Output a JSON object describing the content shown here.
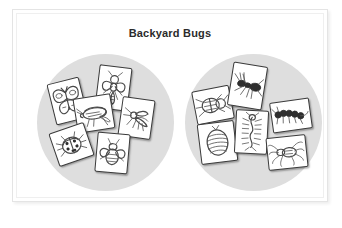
{
  "slide": {
    "title": "Backyard Bugs",
    "background_color": "#ffffff",
    "frame_border_color": "#e4e4e4",
    "title_color": "#2b2b2b"
  },
  "caption": {
    "text": "",
    "note_visible": false
  },
  "groups": [
    {
      "name": "left-group",
      "label": "",
      "fill_color": "#dedede",
      "cards": [
        {
          "name": "card-butterfly",
          "subject": "butterfly",
          "icon": "butterfly-icon",
          "rotation": -14,
          "x": 14,
          "y": 26,
          "w": 33,
          "h": 42
        },
        {
          "name": "card-wasp",
          "subject": "wasp",
          "icon": "wasp-icon",
          "rotation": 7,
          "x": 60,
          "y": 12,
          "w": 33,
          "h": 44
        },
        {
          "name": "card-grasshopper",
          "subject": "grasshopper",
          "icon": "grasshopper-icon",
          "rotation": -9,
          "x": 38,
          "y": 42,
          "w": 38,
          "h": 35
        },
        {
          "name": "card-mosquito",
          "subject": "mosquito",
          "icon": "mosquito-icon",
          "rotation": 8,
          "x": 83,
          "y": 44,
          "w": 33,
          "h": 40
        },
        {
          "name": "card-ladybug",
          "subject": "ladybug",
          "icon": "ladybug-icon",
          "rotation": -19,
          "x": 16,
          "y": 73,
          "w": 37,
          "h": 35
        },
        {
          "name": "card-bee",
          "subject": "bee",
          "icon": "bee-icon",
          "rotation": 5,
          "x": 59,
          "y": 79,
          "w": 33,
          "h": 40
        }
      ]
    },
    {
      "name": "right-group",
      "label": "",
      "fill_color": "#dedede",
      "cards": [
        {
          "name": "card-beetle",
          "subject": "beetle",
          "icon": "beetle-icon",
          "rotation": -11,
          "x": 9,
          "y": 34,
          "w": 38,
          "h": 34
        },
        {
          "name": "card-ant",
          "subject": "ant",
          "icon": "ant-icon",
          "rotation": 9,
          "x": 45,
          "y": 10,
          "w": 35,
          "h": 44
        },
        {
          "name": "card-caterpillar",
          "subject": "caterpillar",
          "icon": "caterpillar-icon",
          "rotation": -8,
          "x": 86,
          "y": 46,
          "w": 40,
          "h": 31
        },
        {
          "name": "card-pillbug",
          "subject": "pillbug",
          "icon": "pillbug-icon",
          "rotation": -7,
          "x": 14,
          "y": 68,
          "w": 37,
          "h": 41
        },
        {
          "name": "card-centipede",
          "subject": "centipede",
          "icon": "centipede-icon",
          "rotation": 3,
          "x": 50,
          "y": 56,
          "w": 33,
          "h": 44
        },
        {
          "name": "card-spider",
          "subject": "spider",
          "icon": "spider-icon",
          "rotation": -6,
          "x": 82,
          "y": 82,
          "w": 40,
          "h": 33
        }
      ]
    }
  ]
}
